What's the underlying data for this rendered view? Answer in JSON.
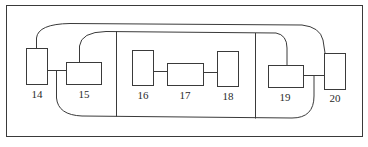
{
  "diagram": {
    "type": "block-diagram",
    "line_color": "#3a3a3a",
    "background": "#ffffff",
    "blocks": [
      {
        "id": "14",
        "label": "14"
      },
      {
        "id": "15",
        "label": "15"
      },
      {
        "id": "16",
        "label": "16"
      },
      {
        "id": "17",
        "label": "17"
      },
      {
        "id": "18",
        "label": "18"
      },
      {
        "id": "19",
        "label": "19"
      },
      {
        "id": "20",
        "label": "20"
      }
    ],
    "connections": [
      {
        "from": "14",
        "to": "15",
        "kind": "straight"
      },
      {
        "from": "16",
        "to": "17",
        "kind": "straight"
      },
      {
        "from": "17",
        "to": "18",
        "kind": "straight"
      },
      {
        "from": "19",
        "to": "20",
        "kind": "straight"
      },
      {
        "from": "14",
        "to": "20",
        "kind": "outer-top-loop"
      },
      {
        "from": "15",
        "to": "19",
        "kind": "inner-top-loop"
      },
      {
        "from": "14-15 junction",
        "to": "19-20 junction",
        "kind": "bottom-loop"
      }
    ],
    "regions": [
      {
        "id": "outer-frame"
      },
      {
        "id": "center-section",
        "contains": [
          "16",
          "17",
          "18"
        ]
      }
    ]
  }
}
